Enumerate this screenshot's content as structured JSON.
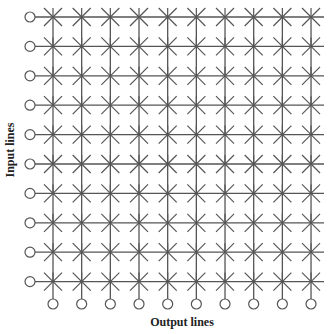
{
  "diagram": {
    "type": "crossbar-switch",
    "rows": 10,
    "cols": 10,
    "input_label": "Input lines",
    "output_label": "Output lines",
    "line_color": "#555555",
    "node_color": "#555555",
    "geometry": {
      "row_y_start": 17,
      "row_spacing": 29.4,
      "col_x_start": 53,
      "col_spacing": 28.67,
      "input_circle_x": 30,
      "output_circle_y": 304,
      "circle_r": 5,
      "line_end_x": 324,
      "star_dx": 9,
      "star_dy": 9
    }
  }
}
